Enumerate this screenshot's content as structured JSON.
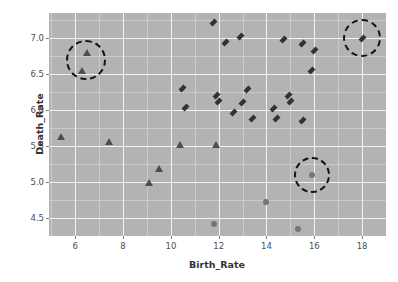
{
  "chart_data": {
    "type": "scatter",
    "title": "",
    "xlabel": "Birth_Rate",
    "ylabel": "Death_Rate",
    "xlim": [
      4.9,
      19.0
    ],
    "ylim": [
      4.25,
      7.35
    ],
    "xticks": [
      6,
      8,
      10,
      12,
      14,
      16,
      18
    ],
    "xtick_labels": [
      "6",
      "8",
      "10",
      "12",
      "14",
      "16",
      "18"
    ],
    "yticks": [
      4.5,
      5.0,
      5.5,
      6.0,
      6.5,
      7.0
    ],
    "ytick_labels": [
      "4.5",
      "5.0",
      "5.5",
      "6.0",
      "6.5",
      "7.0"
    ],
    "grid": true,
    "grid_color": "#f2f2f2",
    "panel_background": "#b3b3b3",
    "legend": "none",
    "series": [
      {
        "name": "diamond-group",
        "marker": "diamond",
        "color": "#2f3237",
        "points": [
          [
            11.8,
            7.22
          ],
          [
            12.9,
            7.02
          ],
          [
            14.7,
            6.98
          ],
          [
            12.3,
            6.94
          ],
          [
            15.5,
            6.92
          ],
          [
            16.0,
            6.83
          ],
          [
            18.0,
            7.0
          ],
          [
            15.9,
            6.55
          ],
          [
            10.5,
            6.3
          ],
          [
            13.2,
            6.28
          ],
          [
            11.9,
            6.21
          ],
          [
            14.9,
            6.21
          ],
          [
            12.0,
            6.12
          ],
          [
            13.0,
            6.1
          ],
          [
            15.0,
            6.12
          ],
          [
            10.6,
            6.03
          ],
          [
            12.6,
            5.97
          ],
          [
            14.3,
            6.02
          ],
          [
            13.4,
            5.88
          ],
          [
            14.4,
            5.89
          ],
          [
            15.5,
            5.86
          ]
        ]
      },
      {
        "name": "triangle-group",
        "marker": "triangle",
        "color": "#4a4e55",
        "points": [
          [
            6.5,
            6.8
          ],
          [
            6.3,
            6.55
          ],
          [
            5.4,
            5.62
          ],
          [
            7.4,
            5.55
          ],
          [
            10.4,
            5.52
          ],
          [
            11.9,
            5.52
          ],
          [
            9.5,
            5.18
          ],
          [
            9.1,
            4.99
          ]
        ]
      },
      {
        "name": "circle-group",
        "marker": "circle",
        "color": "#72767d",
        "points": [
          [
            15.9,
            5.1
          ],
          [
            14.0,
            4.72
          ],
          [
            11.8,
            4.42
          ],
          [
            15.3,
            4.35
          ]
        ]
      }
    ],
    "annotations": [
      {
        "name": "highlight-circle-left",
        "cx": 6.45,
        "cy": 6.7,
        "r_px": 20
      },
      {
        "name": "highlight-circle-right",
        "cx": 18.0,
        "cy": 7.0,
        "r_px": 19
      },
      {
        "name": "highlight-circle-bottom",
        "cx": 15.9,
        "cy": 5.1,
        "r_px": 18
      }
    ]
  }
}
